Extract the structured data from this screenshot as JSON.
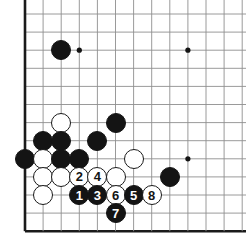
{
  "diagram": {
    "type": "go-board-diagram",
    "board_size": 19,
    "visible_region": "bottom-left corner, cropped",
    "geometry": {
      "origin_x": 25,
      "origin_y": 14,
      "spacing": 18.1,
      "cols": 12,
      "rows": 12,
      "stone_diameter": 20
    },
    "colors": {
      "background": "#ffffff",
      "grid_line": "#8e8e8e",
      "edge_line": "#1a1a1a",
      "black_stone": "#141414",
      "white_stone": "#ffffff",
      "stone_outline": "#1a1a1a",
      "star_point": "#141414"
    },
    "star_points": [
      {
        "name": "star-point-upper-left",
        "col": 3,
        "row": 2
      },
      {
        "name": "star-point-upper-right",
        "col": 9,
        "row": 2
      },
      {
        "name": "star-point-lower-right",
        "col": 9,
        "row": 8
      }
    ],
    "stones": [
      {
        "id": "black-stone-a",
        "color": "black",
        "col": 2,
        "row": 2,
        "label": ""
      },
      {
        "id": "white-stone-a",
        "color": "white",
        "col": 2,
        "row": 6,
        "label": ""
      },
      {
        "id": "black-stone-b",
        "color": "black",
        "col": 5,
        "row": 6,
        "label": ""
      },
      {
        "id": "black-stone-c",
        "color": "black",
        "col": 1,
        "row": 7,
        "label": ""
      },
      {
        "id": "black-stone-d",
        "color": "black",
        "col": 2,
        "row": 7,
        "label": ""
      },
      {
        "id": "black-stone-e",
        "color": "black",
        "col": 4,
        "row": 7,
        "label": ""
      },
      {
        "id": "black-stone-f",
        "color": "black",
        "col": 0,
        "row": 8,
        "label": ""
      },
      {
        "id": "white-stone-b",
        "color": "white",
        "col": 1,
        "row": 8,
        "label": ""
      },
      {
        "id": "black-stone-g",
        "color": "black",
        "col": 2,
        "row": 8,
        "label": ""
      },
      {
        "id": "black-stone-h",
        "color": "black",
        "col": 3,
        "row": 8,
        "label": ""
      },
      {
        "id": "white-stone-c",
        "color": "white",
        "col": 6,
        "row": 8,
        "label": ""
      },
      {
        "id": "white-stone-d",
        "color": "white",
        "col": 1,
        "row": 9,
        "label": ""
      },
      {
        "id": "white-stone-e",
        "color": "white",
        "col": 2,
        "row": 9,
        "label": ""
      },
      {
        "id": "white-stone-f",
        "color": "white",
        "col": 5,
        "row": 9,
        "label": ""
      },
      {
        "id": "black-stone-i",
        "color": "black",
        "col": 8,
        "row": 9,
        "label": ""
      },
      {
        "id": "white-stone-g",
        "color": "white",
        "col": 1,
        "row": 10,
        "label": ""
      },
      {
        "id": "move-2",
        "color": "white",
        "col": 3,
        "row": 9,
        "label": "2"
      },
      {
        "id": "move-4",
        "color": "white",
        "col": 4,
        "row": 9,
        "label": "4"
      },
      {
        "id": "move-1",
        "color": "black",
        "col": 3,
        "row": 10,
        "label": "1"
      },
      {
        "id": "move-3",
        "color": "black",
        "col": 4,
        "row": 10,
        "label": "3"
      },
      {
        "id": "move-6",
        "color": "white",
        "col": 5,
        "row": 10,
        "label": "6"
      },
      {
        "id": "move-5",
        "color": "black",
        "col": 6,
        "row": 10,
        "label": "5"
      },
      {
        "id": "move-8",
        "color": "white",
        "col": 7,
        "row": 10,
        "label": "8"
      },
      {
        "id": "move-7",
        "color": "black",
        "col": 5,
        "row": 11,
        "label": "7"
      }
    ],
    "move_sequence": [
      "1",
      "2",
      "3",
      "4",
      "5",
      "6",
      "7",
      "8"
    ]
  }
}
